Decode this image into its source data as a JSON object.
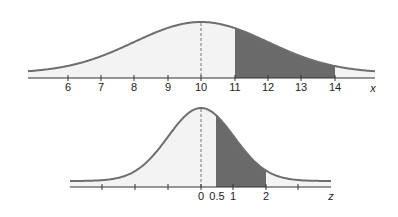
{
  "top_chart": {
    "variable": "x",
    "mean": 10,
    "sd": 2,
    "tick_labels": [
      "6",
      "7",
      "8",
      "9",
      "10",
      "11",
      "12",
      "13",
      "14"
    ],
    "shaded_from": 11,
    "shaded_to": 14
  },
  "bottom_chart": {
    "variable": "z",
    "mean": 0,
    "sd": 1,
    "tick_labels": [
      "0",
      "0.5",
      "1",
      "2"
    ],
    "shaded_from": 0.5,
    "shaded_to": 2
  },
  "colors": {
    "curve": "#6e6e6e",
    "unshaded_fill": "#f3f3f3",
    "shaded_fill": "#6a6a6a",
    "axis": "#333333"
  }
}
